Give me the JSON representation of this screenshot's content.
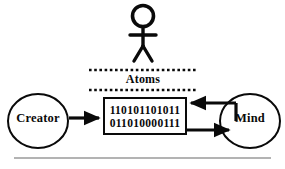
{
  "diagram": {
    "nodes": {
      "creator": {
        "label": "Creator"
      },
      "mind": {
        "label": "Mind"
      }
    },
    "band": {
      "label": "Atoms"
    },
    "data_box": {
      "rows": [
        "110101101011",
        "011010000111"
      ]
    },
    "person": {
      "name": "stick-figure"
    },
    "arrows": [
      {
        "name": "creator-to-atoms",
        "direction": "right"
      },
      {
        "name": "mind-to-atoms",
        "direction": "left"
      },
      {
        "name": "atoms-to-mind",
        "direction": "right"
      }
    ],
    "colors": {
      "ink": "#0a0a0a",
      "rule": "#9a9a9a",
      "background": "#ffffff"
    }
  }
}
